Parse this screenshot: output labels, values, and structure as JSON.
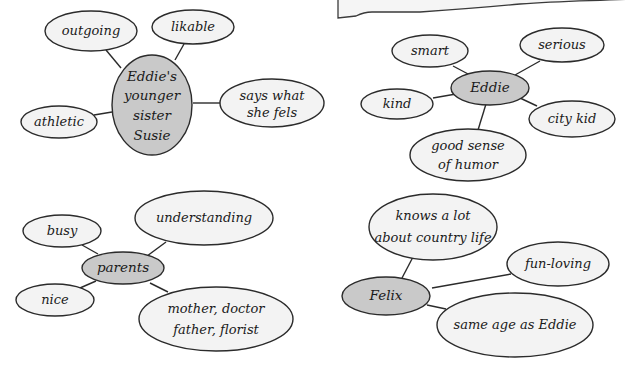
{
  "colors": {
    "bubble_fill": "#f3f3f3",
    "center_fill": "#c9c9c9",
    "stroke": "#2b2b2b",
    "background": "#ffffff"
  },
  "maps": {
    "susie": {
      "center": {
        "lines": [
          "Eddie's",
          "younger",
          "sister",
          "Susie"
        ]
      },
      "traits": [
        {
          "lines": [
            "outgoing"
          ]
        },
        {
          "lines": [
            "likable"
          ]
        },
        {
          "lines": [
            "says what",
            "she fels"
          ]
        },
        {
          "lines": [
            "athletic"
          ]
        }
      ]
    },
    "eddie": {
      "center": {
        "lines": [
          "Eddie"
        ]
      },
      "traits": [
        {
          "lines": [
            "smart"
          ]
        },
        {
          "lines": [
            "serious"
          ]
        },
        {
          "lines": [
            "kind"
          ]
        },
        {
          "lines": [
            "city kid"
          ]
        },
        {
          "lines": [
            "good sense",
            "of humor"
          ]
        }
      ]
    },
    "parents": {
      "center": {
        "lines": [
          "parents"
        ]
      },
      "traits": [
        {
          "lines": [
            "busy"
          ]
        },
        {
          "lines": [
            "understanding"
          ]
        },
        {
          "lines": [
            "nice"
          ]
        },
        {
          "lines": [
            "mother, doctor",
            "father, florist"
          ]
        }
      ]
    },
    "felix": {
      "center": {
        "lines": [
          "Felix"
        ]
      },
      "traits": [
        {
          "lines": [
            "knows a lot",
            "about country life"
          ]
        },
        {
          "lines": [
            "fun-loving"
          ]
        },
        {
          "lines": [
            "same age as Eddie"
          ]
        }
      ]
    }
  }
}
